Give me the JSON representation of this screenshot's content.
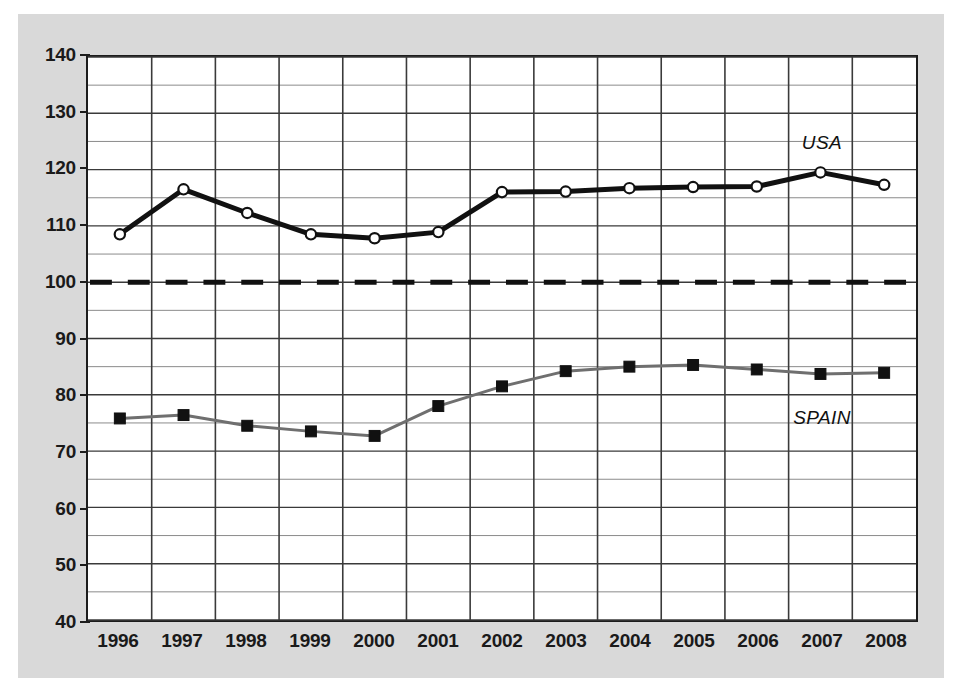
{
  "chart_data": {
    "type": "line",
    "title": "",
    "subtitle": "",
    "xlabel": "",
    "ylabel": "",
    "categories": [
      "1996",
      "1997",
      "1998",
      "1999",
      "2000",
      "2001",
      "2002",
      "2003",
      "2004",
      "2005",
      "2006",
      "2007",
      "2008"
    ],
    "x": [
      1996,
      1997,
      1998,
      1999,
      2000,
      2001,
      2002,
      2003,
      2004,
      2005,
      2006,
      2007,
      2008
    ],
    "ylim": [
      40,
      140
    ],
    "xlim_categories": 13,
    "grid": true,
    "grid_major_step": 10,
    "grid_minor_step": 5,
    "legend_position": "inline-annotation",
    "ytick_labels": [
      "140",
      "130",
      "120",
      "110",
      "100",
      "90",
      "80",
      "70",
      "60",
      "50",
      "40"
    ],
    "ytick_values": [
      140,
      130,
      120,
      110,
      100,
      90,
      80,
      70,
      60,
      50,
      40
    ],
    "series": [
      {
        "name": "USA",
        "marker": "open-circle",
        "color": "#111111",
        "line_width": 5,
        "values": [
          108.5,
          116.5,
          112.3,
          108.5,
          107.8,
          108.9,
          116.0,
          116.1,
          116.7,
          116.9,
          117.0,
          119.5,
          117.3
        ]
      },
      {
        "name": "SPAIN",
        "marker": "filled-square",
        "color": "#6f6f6f",
        "marker_color": "#111111",
        "line_width": 3,
        "values": [
          75.8,
          76.4,
          74.5,
          73.5,
          72.7,
          78.0,
          81.5,
          84.2,
          85.0,
          85.3,
          84.5,
          83.7,
          83.9
        ]
      }
    ],
    "reference_lines": [
      {
        "name": "baseline-100",
        "value": 100,
        "style": "dashed",
        "color": "#111111",
        "line_width": 5
      }
    ],
    "annotations": [
      {
        "text": "USA",
        "x_category": "2007",
        "y_value": 124.5
      },
      {
        "text": "SPAIN",
        "x_category": "2007",
        "y_value": 76.0
      }
    ]
  },
  "colors": {
    "panel_background": "#d9d9d9",
    "plot_background": "#ffffff",
    "frame": "#1c1c1c",
    "grid_major": "#3a3a3a",
    "grid_minor": "#8a8a8a",
    "usa_line": "#111111",
    "spain_line": "#6f6f6f",
    "text": "#1a1a1a"
  }
}
